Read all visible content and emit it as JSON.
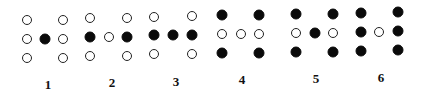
{
  "figures": [
    {
      "label": "1",
      "label_pos": [
        48,
        85
      ],
      "dots": [
        {
          "x": 27,
          "y": 20,
          "filled": false
        },
        {
          "x": 63,
          "y": 20,
          "filled": false
        },
        {
          "x": 27,
          "y": 39,
          "filled": false
        },
        {
          "x": 45,
          "y": 39,
          "filled": true
        },
        {
          "x": 63,
          "y": 39,
          "filled": false
        },
        {
          "x": 27,
          "y": 58,
          "filled": false
        },
        {
          "x": 63,
          "y": 58,
          "filled": false
        }
      ]
    },
    {
      "label": "2",
      "label_pos": [
        112,
        83
      ],
      "dots": [
        {
          "x": 90,
          "y": 18,
          "filled": false
        },
        {
          "x": 127,
          "y": 18,
          "filled": false
        },
        {
          "x": 90,
          "y": 37,
          "filled": true
        },
        {
          "x": 109,
          "y": 37,
          "filled": false
        },
        {
          "x": 127,
          "y": 37,
          "filled": true
        },
        {
          "x": 90,
          "y": 56,
          "filled": false
        },
        {
          "x": 127,
          "y": 56,
          "filled": false
        }
      ]
    },
    {
      "label": "3",
      "label_pos": [
        176,
        82
      ],
      "dots": [
        {
          "x": 154,
          "y": 17,
          "filled": false
        },
        {
          "x": 192,
          "y": 16,
          "filled": false
        },
        {
          "x": 154,
          "y": 35,
          "filled": true
        },
        {
          "x": 173,
          "y": 35,
          "filled": true
        },
        {
          "x": 192,
          "y": 35,
          "filled": true
        },
        {
          "x": 154,
          "y": 54,
          "filled": false
        },
        {
          "x": 192,
          "y": 54,
          "filled": false
        }
      ]
    },
    {
      "label": "4",
      "label_pos": [
        242,
        80
      ],
      "dots": [
        {
          "x": 222,
          "y": 15,
          "filled": true
        },
        {
          "x": 259,
          "y": 15,
          "filled": true
        },
        {
          "x": 222,
          "y": 34,
          "filled": false
        },
        {
          "x": 241,
          "y": 34,
          "filled": false
        },
        {
          "x": 259,
          "y": 34,
          "filled": false
        },
        {
          "x": 222,
          "y": 53,
          "filled": true
        },
        {
          "x": 259,
          "y": 53,
          "filled": true
        }
      ]
    },
    {
      "label": "5",
      "label_pos": [
        316,
        79
      ],
      "dots": [
        {
          "x": 296,
          "y": 14,
          "filled": true
        },
        {
          "x": 333,
          "y": 14,
          "filled": true
        },
        {
          "x": 296,
          "y": 33,
          "filled": false
        },
        {
          "x": 315,
          "y": 33,
          "filled": true
        },
        {
          "x": 333,
          "y": 33,
          "filled": false
        },
        {
          "x": 296,
          "y": 52,
          "filled": true
        },
        {
          "x": 333,
          "y": 52,
          "filled": true
        }
      ]
    },
    {
      "label": "6",
      "label_pos": [
        381,
        78
      ],
      "dots": [
        {
          "x": 361,
          "y": 13,
          "filled": true
        },
        {
          "x": 398,
          "y": 12,
          "filled": true
        },
        {
          "x": 361,
          "y": 32,
          "filled": true
        },
        {
          "x": 379,
          "y": 32,
          "filled": false
        },
        {
          "x": 398,
          "y": 31,
          "filled": true
        },
        {
          "x": 361,
          "y": 51,
          "filled": true
        },
        {
          "x": 398,
          "y": 50,
          "filled": true
        }
      ]
    }
  ],
  "colors": {
    "filled": "#0a0a0a",
    "outline": "#222222",
    "background": "#ffffff"
  }
}
